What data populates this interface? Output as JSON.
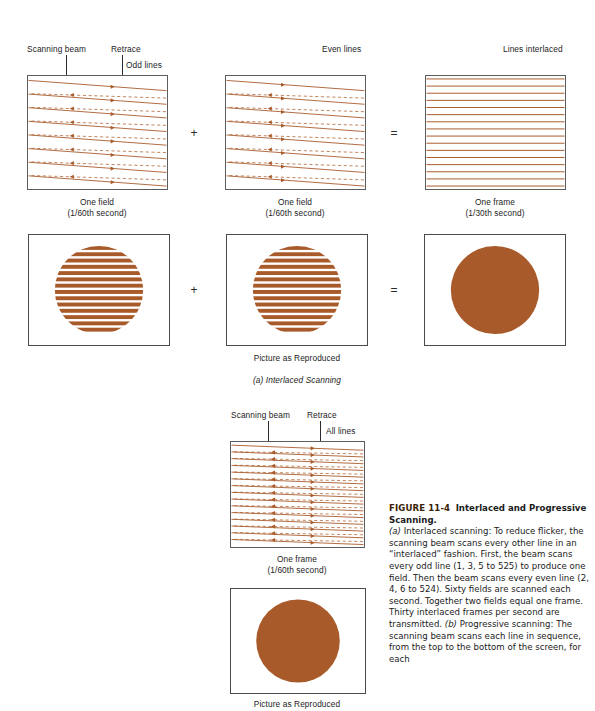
{
  "figure": {
    "number": "FIGURE 11-4",
    "title": "Interlaced and Progressive Scanning.",
    "caption_a_marker": "(a)",
    "caption_a": " Interlaced scanning: To reduce flicker, the scanning beam scans every other line in an “interlaced” fashion. First, the beam scans every odd line (1, 3, 5 to 525) to produce one field. Then the beam scans every even line (2, 4, 6 to 524). Sixty fields are scanned each second. Together two fields equal one frame. Thirty interlaced frames per second are transmitted. ",
    "caption_b_marker": "(b)",
    "caption_b": " Progressive scanning: The scanning beam scans each line in sequence, from the top to the bottom of the screen, for each"
  },
  "colors": {
    "scan_line": "#A85A2A",
    "circle_fill": "#A85A2A",
    "box_border": "#5d5d5d",
    "text": "#1c1c1c",
    "fignum": "#3a1e08"
  },
  "section_a": {
    "part_label": "(a) Interlaced Scanning",
    "panels": [
      {
        "id": "odd-field",
        "top_labels": [
          "Scanning beam",
          "Retrace",
          "Odd lines"
        ],
        "caption_line1": "One field",
        "caption_line2": "(1/60th second)",
        "lines": 8,
        "pattern": "trace-retrace"
      },
      {
        "id": "even-field",
        "top_labels": [
          "Even lines"
        ],
        "caption_line1": "One field",
        "caption_line2": "(1/60th second)",
        "lines": 8,
        "pattern": "trace-retrace"
      },
      {
        "id": "interlaced-frame",
        "top_labels": [
          "Lines interlaced"
        ],
        "caption_line1": "One frame",
        "caption_line2": "(1/30th second)",
        "lines": 16,
        "pattern": "solid-lines"
      }
    ],
    "operators": [
      "+",
      "="
    ],
    "picture_row": {
      "caption": "Picture as Reproduced",
      "pictures": [
        {
          "id": "odd-striped-circle",
          "fill": "striped",
          "stripes": 14
        },
        {
          "id": "even-striped-circle",
          "fill": "striped",
          "stripes": 14
        },
        {
          "id": "solid-circle",
          "fill": "solid"
        }
      ],
      "operators": [
        "+",
        "="
      ]
    }
  },
  "section_b": {
    "panel": {
      "id": "progressive-frame",
      "top_labels": [
        "Scanning beam",
        "Retrace",
        "All lines"
      ],
      "caption_line1": "One frame",
      "caption_line2": "(1/60th second)",
      "lines": 15,
      "pattern": "trace-retrace"
    },
    "picture": {
      "id": "progressive-solid-circle",
      "fill": "solid",
      "caption": "Picture as Reproduced"
    }
  }
}
